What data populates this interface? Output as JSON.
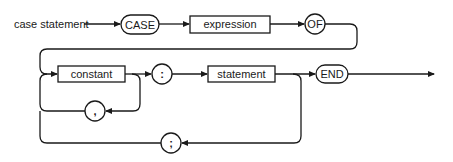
{
  "diagram": {
    "type": "syntax-diagram",
    "title": "case statement",
    "nodes": {
      "case_kw": "CASE",
      "expression": "expression",
      "of_kw": "OF",
      "constant": "constant",
      "colon": ":",
      "statement": "statement",
      "end_kw": "END",
      "comma": ",",
      "semicolon": ";"
    },
    "colors": {
      "stroke": "#1a1a1a",
      "background": "#ffffff"
    }
  }
}
